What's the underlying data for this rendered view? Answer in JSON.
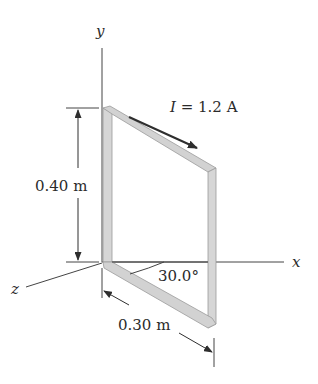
{
  "figure": {
    "type": "rectangular current loop in 3D axes",
    "axes": {
      "x_label": "x",
      "y_label": "y",
      "z_label": "z"
    },
    "current": {
      "symbol": "I",
      "equals": "= 1.2 A",
      "value": 1.2,
      "unit": "A"
    },
    "dimensions": {
      "height_label": "0.40 m",
      "height_value": 0.4,
      "width_label": "0.30 m",
      "width_value": 0.3
    },
    "angle": {
      "label": "30.0°",
      "value": 30.0
    },
    "colors": {
      "line": "#3a3a3a",
      "wire_fill": "#d4d4d4",
      "wire_edge": "#9a9a9a",
      "text": "#2b2b2b"
    }
  }
}
